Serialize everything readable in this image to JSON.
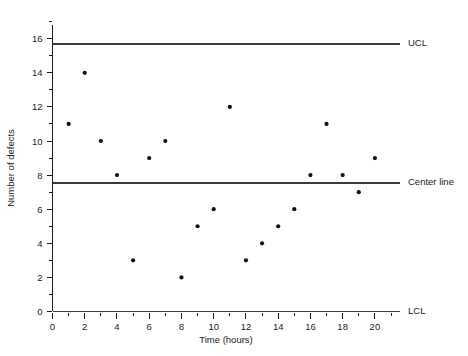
{
  "chart_data": {
    "type": "scatter",
    "title": "",
    "xlabel": "Time (hours)",
    "ylabel": "Number of defects",
    "xlim": [
      0,
      21
    ],
    "ylim": [
      0,
      17
    ],
    "grid": false,
    "legend_position": "right-outside",
    "x": [
      1,
      2,
      3,
      4,
      5,
      6,
      7,
      8,
      9,
      10,
      11,
      12,
      13,
      14,
      15,
      16,
      17,
      18,
      19,
      20
    ],
    "values": [
      11,
      14,
      10,
      8,
      3,
      9,
      10,
      2,
      5,
      6,
      12,
      3,
      4,
      5,
      6,
      8,
      11,
      8,
      7,
      9
    ],
    "series": [
      {
        "name": "Number of defects",
        "x": [
          1,
          2,
          3,
          4,
          5,
          6,
          7,
          8,
          9,
          10,
          11,
          12,
          13,
          14,
          15,
          16,
          17,
          18,
          19,
          20
        ],
        "values": [
          11,
          14,
          10,
          8,
          3,
          9,
          10,
          2,
          5,
          6,
          12,
          3,
          4,
          5,
          6,
          8,
          11,
          8,
          7,
          9
        ]
      }
    ],
    "x_major_ticks": [
      0,
      2,
      4,
      6,
      8,
      10,
      12,
      14,
      16,
      18,
      20
    ],
    "x_major_tick_labels": [
      "0",
      "2",
      "4",
      "6",
      "8",
      "10",
      "12",
      "14",
      "16",
      "18",
      "20"
    ],
    "x_minor_ticks": [
      1,
      3,
      5,
      7,
      9,
      11,
      13,
      15,
      17,
      19,
      21
    ],
    "y_major_ticks": [
      0,
      2,
      4,
      6,
      8,
      10,
      12,
      14,
      16
    ],
    "y_major_tick_labels": [
      "0",
      "2",
      "4",
      "6",
      "8",
      "10",
      "12",
      "14",
      "16"
    ],
    "y_minor_ticks": [
      1,
      3,
      5,
      7,
      9,
      11,
      13,
      15,
      17
    ],
    "control_limits": [
      {
        "key": "ucl",
        "label": "UCL",
        "value": 15.7
      },
      {
        "key": "center",
        "label": "Center line",
        "value": 7.55
      },
      {
        "key": "lcl",
        "label": "LCL",
        "value": 0
      }
    ],
    "colors": {
      "axis": "#1a1a1a",
      "limit_line": "#3a3a3a",
      "point": "#111111",
      "text": "#222222",
      "background": "#ffffff"
    }
  }
}
